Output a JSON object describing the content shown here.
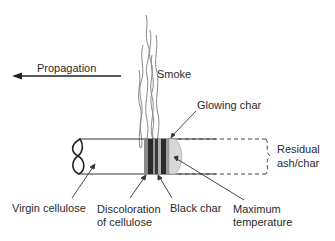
{
  "diagram": {
    "propagation_label": "Propagation",
    "smoke_label": "Smoke",
    "glowing_char_label": "Glowing char",
    "residual_label_line1": "Residual",
    "residual_label_line2": "ash/char",
    "virgin_label": "Virgin cellulose",
    "discoloration_line1": "Discoloration",
    "discoloration_line2": "of cellulose",
    "black_char_label": "Black char",
    "max_temp_line1": "Maximum",
    "max_temp_line2": "temperature",
    "colors": {
      "line": "#333333",
      "char_dark": "#2b2b2b",
      "char_mid": "#7a7a7a",
      "glow": "#d9d9d9",
      "smoke": "#888888"
    }
  }
}
